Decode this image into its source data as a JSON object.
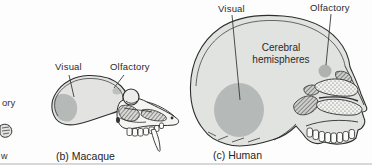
{
  "figure": {
    "background": "#fdfdfd",
    "colors": {
      "outline": "#2e2e2e",
      "skull_fill": "#e3e4e2",
      "region_highlight": "#b5b9b7",
      "label_text": "#2a2a2a",
      "bottom_edge": "#d8d8d8"
    },
    "cropped_left_panel": {
      "label_fragment": "ory",
      "caption_fragment": "w"
    },
    "macaque_panel": {
      "visual_label": "Visual",
      "olfactory_label": "Olfactory",
      "caption": "(b) Macaque"
    },
    "human_panel": {
      "visual_label": "Visual",
      "olfactory_label": "Olfactory",
      "cerebral_label": "Cerebral hemispheres",
      "caption": "(c) Human"
    }
  }
}
